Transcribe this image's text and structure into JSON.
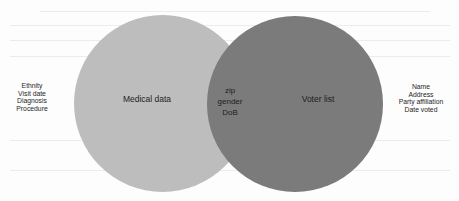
{
  "diagram": {
    "type": "venn",
    "colors": {
      "background": "#fdfdfd",
      "left_circle": "#bdbdbd",
      "right_circle": "#7b7b7b",
      "text": "#1e1e1e"
    },
    "sets": [
      {
        "id": "left",
        "label": "Medical data",
        "outside_attributes": [
          "Ethnity",
          "Visit date",
          "Diagnosis",
          "Procedure"
        ]
      },
      {
        "id": "right",
        "label": "Voter list",
        "outside_attributes": [
          "Name",
          "Address",
          "Party affiliation",
          "Date voted"
        ]
      }
    ],
    "intersection": {
      "attributes": [
        "zip",
        "gender",
        "DoB"
      ]
    }
  }
}
